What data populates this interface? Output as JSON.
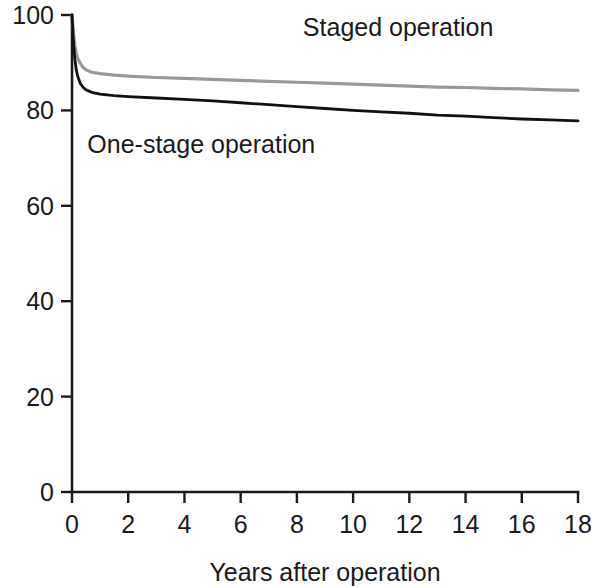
{
  "chart_data": {
    "type": "line",
    "title": "",
    "subtitle": "",
    "xlabel": "Years after operation",
    "ylabel": "",
    "xlim": [
      0,
      18
    ],
    "ylim": [
      0,
      100
    ],
    "xticks": [
      0,
      2,
      4,
      6,
      8,
      10,
      12,
      14,
      16,
      18
    ],
    "xtick_labels": [
      "0",
      "2",
      "4",
      "6",
      "8",
      "10",
      "12",
      "14",
      "16",
      "18"
    ],
    "yticks": [
      0,
      20,
      40,
      60,
      80,
      100
    ],
    "ytick_labels": [
      "0",
      "20",
      "40",
      "60",
      "80",
      "100"
    ],
    "grid": false,
    "legend_position": "inline-annotations",
    "series": [
      {
        "name": "Staged operation",
        "color": "#999999",
        "linewidth": 3.2,
        "label_x": 11.6,
        "label_y": 95.5,
        "x": [
          0,
          0.05,
          0.1,
          0.15,
          0.2,
          0.3,
          0.4,
          0.5,
          0.7,
          1,
          1.5,
          2,
          3,
          4,
          5,
          6,
          7,
          8,
          9,
          10,
          11,
          12,
          13,
          14,
          15,
          16,
          17,
          18
        ],
        "values": [
          100,
          96.2,
          93.6,
          92.0,
          91.0,
          89.8,
          89.0,
          88.5,
          88.0,
          87.7,
          87.4,
          87.2,
          86.9,
          86.7,
          86.5,
          86.3,
          86.1,
          85.9,
          85.7,
          85.5,
          85.3,
          85.1,
          84.9,
          84.8,
          84.6,
          84.5,
          84.3,
          84.2
        ]
      },
      {
        "name": "One-stage operation",
        "color": "#111111",
        "linewidth": 2.8,
        "label_x": 4.6,
        "label_y": 71.0,
        "x": [
          0,
          0.05,
          0.1,
          0.15,
          0.2,
          0.3,
          0.4,
          0.5,
          0.7,
          1,
          1.5,
          2,
          3,
          4,
          5,
          6,
          7,
          8,
          9,
          10,
          11,
          12,
          13,
          14,
          15,
          16,
          17,
          18
        ],
        "values": [
          100,
          94.5,
          90.8,
          88.6,
          87.2,
          85.6,
          84.8,
          84.3,
          83.8,
          83.4,
          83.1,
          82.9,
          82.6,
          82.3,
          82.0,
          81.6,
          81.2,
          80.8,
          80.4,
          80.0,
          79.7,
          79.4,
          79.0,
          78.8,
          78.5,
          78.2,
          78.0,
          77.8
        ]
      }
    ]
  }
}
